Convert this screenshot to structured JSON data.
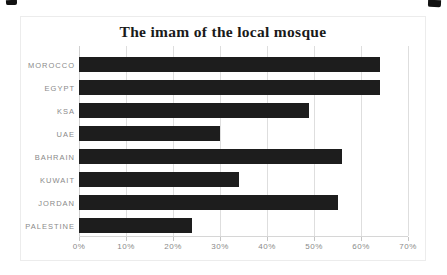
{
  "chart_data": {
    "type": "bar",
    "orientation": "horizontal",
    "title": "The imam of the local mosque",
    "categories": [
      "MOROCCO",
      "EGYPT",
      "KSA",
      "UAE",
      "BAHRAIN",
      "KUWAIT",
      "JORDAN",
      "PALESTINE"
    ],
    "values": [
      64,
      64,
      49,
      30,
      56,
      34,
      55,
      24
    ],
    "x_ticks": [
      "0%",
      "10%",
      "20%",
      "30%",
      "40%",
      "50%",
      "60%",
      "70%"
    ],
    "x_tick_values": [
      0,
      10,
      20,
      30,
      40,
      50,
      60,
      70
    ],
    "xlim": [
      0,
      70
    ],
    "xlabel": "",
    "ylabel": "",
    "grid": true,
    "legend": false,
    "colors": {
      "bar": "#1d1d1d",
      "title": "#1a1a1a",
      "labels": "#8a8a8a",
      "gridline": "#dedede",
      "axis_line": "#d6d6d6",
      "frame_border": "#ececec",
      "background": "#ffffff"
    }
  }
}
